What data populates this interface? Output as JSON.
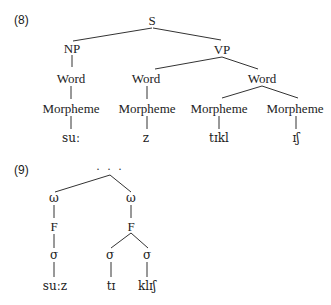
{
  "examples": [
    {
      "number": "(8)",
      "type": "morphosyntactic-tree",
      "nodes": {
        "root": "S",
        "np": "NP",
        "vp": "VP",
        "word1": "Word",
        "word2": "Word",
        "word3": "Word",
        "morph1": "Morpheme",
        "morph2": "Morpheme",
        "morph3": "Morpheme",
        "morph4": "Morpheme",
        "leaf1": "suː",
        "leaf2": "z",
        "leaf3": "tɪkl",
        "leaf4": "ɪʃ"
      }
    },
    {
      "number": "(9)",
      "type": "prosodic-tree",
      "nodes": {
        "root": "· · ·",
        "pw1": "ω",
        "pw2": "ω",
        "foot1": "F",
        "foot2": "F",
        "syl1": "σ",
        "syl2": "σ",
        "syl3": "σ",
        "leaf1": "suːz",
        "leaf2": "tɪ",
        "leaf3": "klɪʃ"
      }
    }
  ]
}
